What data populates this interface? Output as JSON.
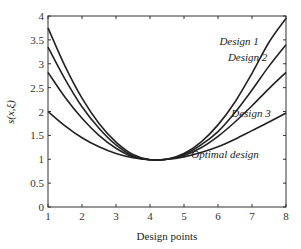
{
  "chart_data": {
    "type": "line",
    "title": "",
    "xlabel": "Design points",
    "ylabel": "s(x,ξ)",
    "xlim": [
      1,
      8
    ],
    "ylim": [
      0,
      4
    ],
    "xticks": [
      "1",
      "2",
      "3",
      "4",
      "5",
      "6",
      "7",
      "8"
    ],
    "yticks": [
      "0",
      "0.5",
      "1",
      "1.5",
      "2",
      "2.5",
      "3",
      "3.5",
      "4"
    ],
    "grid": false,
    "legend": "inline annotations near right side",
    "x": [
      1,
      1.5,
      2,
      2.5,
      3,
      3.5,
      4,
      4.5,
      5,
      5.5,
      6,
      6.5,
      7,
      7.5,
      8
    ],
    "series": [
      {
        "name": "Design 1",
        "values": [
          3.75,
          2.95,
          2.28,
          1.75,
          1.36,
          1.1,
          0.99,
          1.0,
          1.12,
          1.36,
          1.72,
          2.2,
          2.8,
          3.45,
          3.95
        ]
      },
      {
        "name": "Design 2",
        "values": [
          3.35,
          2.68,
          2.1,
          1.65,
          1.3,
          1.07,
          0.99,
          1.0,
          1.1,
          1.3,
          1.58,
          1.98,
          2.45,
          2.95,
          3.4
        ]
      },
      {
        "name": "Design 3",
        "values": [
          2.82,
          2.3,
          1.86,
          1.5,
          1.23,
          1.05,
          0.99,
          1.0,
          1.08,
          1.24,
          1.48,
          1.78,
          2.12,
          2.48,
          2.82
        ]
      },
      {
        "name": "Optimal design",
        "values": [
          2.0,
          1.7,
          1.45,
          1.26,
          1.12,
          1.03,
          0.99,
          1.0,
          1.05,
          1.14,
          1.26,
          1.42,
          1.6,
          1.78,
          1.97
        ]
      }
    ],
    "annotations": [
      {
        "text": "Design 1",
        "x": 7.2,
        "y": 3.4
      },
      {
        "text": "Design 2",
        "x": 7.45,
        "y": 3.05
      },
      {
        "text": "Design 3",
        "x": 7.55,
        "y": 1.88
      },
      {
        "text": "Optimal design",
        "x": 7.2,
        "y": 1.02
      }
    ]
  }
}
